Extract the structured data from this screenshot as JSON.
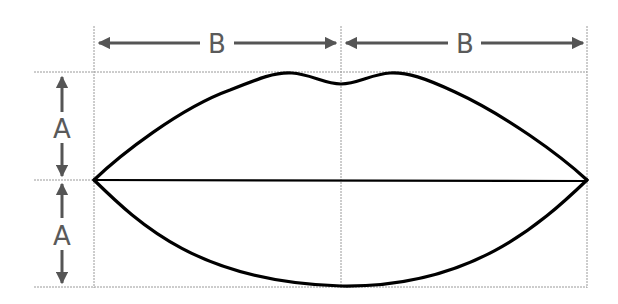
{
  "diagram": {
    "labels": {
      "width_left": "B",
      "width_right": "B",
      "height_top": "A",
      "height_bottom": "A"
    },
    "colors": {
      "guide": "#9a9a9a",
      "arrow": "#555555",
      "outline": "#000000",
      "label": "#5a5a5a"
    },
    "guides": {
      "left_x": 94,
      "center_x": 341,
      "right_x": 587,
      "top_y": 72,
      "middle_y": 180,
      "bottom_y": 287
    }
  }
}
